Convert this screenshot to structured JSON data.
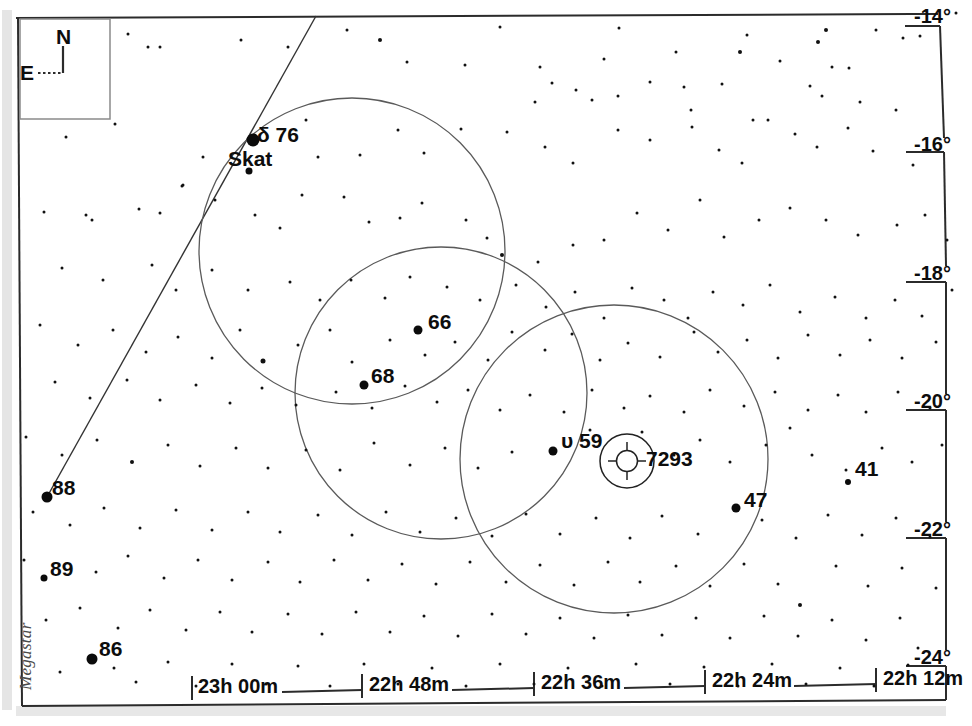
{
  "chart_data": {
    "type": "scatter",
    "xlabel": "Right Ascension",
    "ylabel": "Declination",
    "grid": false,
    "legend": false,
    "x_axis": {
      "position": "bottom",
      "unit": "hours-minutes",
      "direction": "decreasing-right",
      "ticks": [
        {
          "label": "23h 00m",
          "px": 192
        },
        {
          "label": "22h 48m",
          "px": 362
        },
        {
          "label": "22h 36m",
          "px": 534
        },
        {
          "label": "22h 24m",
          "px": 705
        },
        {
          "label": "22h 12m",
          "px": 876
        }
      ],
      "range": [
        "23h 08m",
        "22h 09m"
      ]
    },
    "y_axis": {
      "position": "right",
      "unit": "degrees",
      "direction": "decreasing-down",
      "ticks": [
        {
          "label": "-14°",
          "px": 18
        },
        {
          "label": "-16°",
          "px": 146
        },
        {
          "label": "-18°",
          "px": 275
        },
        {
          "label": "-20°",
          "px": 403
        },
        {
          "label": "-22°",
          "px": 531
        },
        {
          "label": "-24°",
          "px": 659
        }
      ],
      "range": [
        "-13.8°",
        "-24.6°"
      ]
    },
    "labeled_objects": [
      {
        "name": "δ  76",
        "secondary": "Skat",
        "type": "star",
        "x": 253,
        "y": 140,
        "mag_size": 13
      },
      {
        "name": "66",
        "type": "star",
        "x": 418,
        "y": 330,
        "mag_size": 9
      },
      {
        "name": "68",
        "type": "star",
        "x": 364,
        "y": 385,
        "mag_size": 9
      },
      {
        "name": "υ  59",
        "type": "star",
        "x": 553,
        "y": 451,
        "mag_size": 9
      },
      {
        "name": "47",
        "type": "star",
        "x": 736,
        "y": 508,
        "mag_size": 9
      },
      {
        "name": "41",
        "type": "star",
        "x": 848,
        "y": 482,
        "mag_size": 6
      },
      {
        "name": "88",
        "type": "star",
        "x": 47,
        "y": 497,
        "mag_size": 11
      },
      {
        "name": "89",
        "type": "star",
        "x": 44,
        "y": 578,
        "mag_size": 7
      },
      {
        "name": "86",
        "type": "star",
        "x": 92,
        "y": 659,
        "mag_size": 11
      },
      {
        "name": "7293",
        "type": "planetary-nebula",
        "x": 627,
        "y": 461,
        "mag_size": 0
      }
    ],
    "field_circles": [
      {
        "cx": 352,
        "cy": 251,
        "r": 153,
        "note": "finder field 1"
      },
      {
        "cx": 441,
        "cy": 393,
        "r": 146,
        "note": "finder field 2"
      },
      {
        "cx": 614,
        "cy": 459,
        "r": 154,
        "note": "finder field 3"
      },
      {
        "cx": 627,
        "cy": 461,
        "r": 27,
        "note": "nebula extent"
      }
    ],
    "lines": [
      {
        "name": "constellation-line",
        "from": [
          47,
          497
        ],
        "to": [
          315,
          17
        ]
      }
    ]
  },
  "compass": {
    "north_label": "N",
    "east_label": "E"
  },
  "watermark": {
    "text": "Megastar"
  },
  "labels": {
    "delta76": "δ  76",
    "skat": "Skat",
    "s66": "66",
    "s68": "68",
    "upsilon59": "υ  59",
    "n7293": "7293",
    "s47": "47",
    "s41": "41",
    "s88": "88",
    "s89": "89",
    "s86": "86"
  },
  "axis": {
    "ra": {
      "t0": "23h 00m",
      "t1": "22h 48m",
      "t2": "22h 36m",
      "t3": "22h 24m",
      "t4": "22h 12m"
    },
    "dec": {
      "d0": "-14°",
      "d1": "-16°",
      "d2": "-18°",
      "d3": "-20°",
      "d4": "-22°",
      "d5": "-24°"
    }
  },
  "colors": {
    "background": "#ffffff",
    "ink": "#111111",
    "frame": "#2b2b2b",
    "circle": "#555555",
    "watermark": "#4a4a4a"
  },
  "starfield": [
    [
      128,
      34,
      3
    ],
    [
      148,
      47,
      3
    ],
    [
      160,
      47,
      3
    ],
    [
      182,
      186,
      3
    ],
    [
      86,
      215,
      3
    ],
    [
      160,
      213,
      3
    ],
    [
      241,
      40,
      3
    ],
    [
      288,
      47,
      3
    ],
    [
      347,
      30,
      3
    ],
    [
      380,
      40,
      4
    ],
    [
      407,
      62,
      3
    ],
    [
      465,
      65,
      3
    ],
    [
      500,
      27,
      3
    ],
    [
      540,
      67,
      3
    ],
    [
      604,
      59,
      3
    ],
    [
      619,
      28,
      3
    ],
    [
      676,
      52,
      3
    ],
    [
      691,
      110,
      3
    ],
    [
      740,
      52,
      4
    ],
    [
      747,
      35,
      3
    ],
    [
      780,
      61,
      3
    ],
    [
      818,
      42,
      4
    ],
    [
      826,
      30,
      4
    ],
    [
      832,
      67,
      3
    ],
    [
      849,
      68,
      3
    ],
    [
      876,
      30,
      3
    ],
    [
      903,
      38,
      3
    ],
    [
      920,
      36,
      3
    ],
    [
      956,
      13,
      3
    ],
    [
      810,
      86,
      3
    ],
    [
      722,
      84,
      3
    ],
    [
      684,
      87,
      3
    ],
    [
      650,
      82,
      3
    ],
    [
      592,
      100,
      3
    ],
    [
      576,
      90,
      3
    ],
    [
      552,
      83,
      3
    ],
    [
      618,
      96,
      3
    ],
    [
      753,
      120,
      3
    ],
    [
      768,
      120,
      3
    ],
    [
      822,
      96,
      3
    ],
    [
      860,
      102,
      3
    ],
    [
      896,
      110,
      3
    ],
    [
      66,
      137,
      3
    ],
    [
      115,
      124,
      3
    ],
    [
      203,
      157,
      3
    ],
    [
      250,
      170,
      4
    ],
    [
      306,
      120,
      3
    ],
    [
      318,
      157,
      3
    ],
    [
      360,
      155,
      3
    ],
    [
      398,
      130,
      3
    ],
    [
      424,
      153,
      3
    ],
    [
      461,
      129,
      3
    ],
    [
      507,
      132,
      3
    ],
    [
      535,
      102,
      3
    ],
    [
      545,
      147,
      3
    ],
    [
      573,
      163,
      3
    ],
    [
      618,
      130,
      3
    ],
    [
      650,
      140,
      3
    ],
    [
      692,
      127,
      3
    ],
    [
      719,
      150,
      3
    ],
    [
      742,
      163,
      3
    ],
    [
      795,
      134,
      3
    ],
    [
      817,
      147,
      3
    ],
    [
      848,
      128,
      3
    ],
    [
      873,
      151,
      3
    ],
    [
      913,
      165,
      3
    ],
    [
      44,
      212,
      3
    ],
    [
      92,
      220,
      3
    ],
    [
      139,
      209,
      3
    ],
    [
      183,
      185,
      3
    ],
    [
      215,
      200,
      3
    ],
    [
      255,
      215,
      3
    ],
    [
      280,
      228,
      3
    ],
    [
      302,
      195,
      3
    ],
    [
      344,
      197,
      3
    ],
    [
      369,
      222,
      3
    ],
    [
      400,
      218,
      3
    ],
    [
      422,
      203,
      3
    ],
    [
      466,
      220,
      3
    ],
    [
      487,
      238,
      3
    ],
    [
      502,
      255,
      4
    ],
    [
      538,
      262,
      3
    ],
    [
      573,
      245,
      3
    ],
    [
      604,
      240,
      3
    ],
    [
      637,
      213,
      3
    ],
    [
      668,
      230,
      3
    ],
    [
      700,
      200,
      3
    ],
    [
      724,
      237,
      3
    ],
    [
      759,
      220,
      3
    ],
    [
      790,
      208,
      3
    ],
    [
      826,
      220,
      3
    ],
    [
      858,
      235,
      3
    ],
    [
      897,
      225,
      3
    ],
    [
      925,
      215,
      3
    ],
    [
      947,
      240,
      3
    ],
    [
      62,
      268,
      3
    ],
    [
      103,
      280,
      3
    ],
    [
      152,
      265,
      3
    ],
    [
      176,
      290,
      3
    ],
    [
      212,
      270,
      3
    ],
    [
      248,
      290,
      3
    ],
    [
      290,
      282,
      3
    ],
    [
      320,
      300,
      3
    ],
    [
      351,
      280,
      3
    ],
    [
      385,
      298,
      3
    ],
    [
      410,
      277,
      3
    ],
    [
      447,
      287,
      3
    ],
    [
      480,
      300,
      3
    ],
    [
      516,
      285,
      3
    ],
    [
      546,
      307,
      3
    ],
    [
      575,
      292,
      3
    ],
    [
      604,
      318,
      3
    ],
    [
      632,
      288,
      3
    ],
    [
      664,
      300,
      3
    ],
    [
      688,
      318,
      3
    ],
    [
      713,
      292,
      3
    ],
    [
      743,
      305,
      3
    ],
    [
      770,
      285,
      3
    ],
    [
      800,
      312,
      3
    ],
    [
      835,
      297,
      3
    ],
    [
      866,
      318,
      3
    ],
    [
      895,
      300,
      3
    ],
    [
      922,
      316,
      3
    ],
    [
      952,
      290,
      3
    ],
    [
      40,
      325,
      3
    ],
    [
      78,
      345,
      3
    ],
    [
      113,
      330,
      3
    ],
    [
      146,
      352,
      3
    ],
    [
      178,
      337,
      3
    ],
    [
      212,
      358,
      3
    ],
    [
      240,
      330,
      3
    ],
    [
      263,
      361,
      5
    ],
    [
      298,
      345,
      3
    ],
    [
      330,
      330,
      3
    ],
    [
      352,
      362,
      3
    ],
    [
      390,
      340,
      3
    ],
    [
      425,
      355,
      3
    ],
    [
      455,
      342,
      3
    ],
    [
      488,
      360,
      3
    ],
    [
      512,
      332,
      3
    ],
    [
      545,
      350,
      3
    ],
    [
      572,
      334,
      3
    ],
    [
      600,
      360,
      3
    ],
    [
      628,
      343,
      3
    ],
    [
      660,
      357,
      3
    ],
    [
      694,
      332,
      3
    ],
    [
      718,
      352,
      3
    ],
    [
      747,
      340,
      3
    ],
    [
      778,
      358,
      3
    ],
    [
      808,
      335,
      3
    ],
    [
      840,
      355,
      3
    ],
    [
      870,
      340,
      3
    ],
    [
      902,
      358,
      3
    ],
    [
      936,
      342,
      3
    ],
    [
      55,
      382,
      3
    ],
    [
      90,
      398,
      3
    ],
    [
      127,
      380,
      3
    ],
    [
      160,
      400,
      3
    ],
    [
      196,
      385,
      3
    ],
    [
      230,
      403,
      3
    ],
    [
      262,
      388,
      3
    ],
    [
      296,
      405,
      3
    ],
    [
      336,
      392,
      3
    ],
    [
      372,
      408,
      3
    ],
    [
      405,
      386,
      3
    ],
    [
      437,
      402,
      3
    ],
    [
      468,
      390,
      3
    ],
    [
      500,
      410,
      3
    ],
    [
      530,
      395,
      3
    ],
    [
      564,
      412,
      3
    ],
    [
      592,
      390,
      3
    ],
    [
      624,
      408,
      3
    ],
    [
      650,
      396,
      3
    ],
    [
      684,
      412,
      3
    ],
    [
      710,
      390,
      3
    ],
    [
      744,
      406,
      3
    ],
    [
      775,
      392,
      3
    ],
    [
      808,
      410,
      3
    ],
    [
      838,
      395,
      3
    ],
    [
      866,
      412,
      3
    ],
    [
      898,
      392,
      3
    ],
    [
      930,
      408,
      3
    ],
    [
      26,
      437,
      3
    ],
    [
      62,
      455,
      3
    ],
    [
      97,
      440,
      3
    ],
    [
      132,
      462,
      4
    ],
    [
      168,
      445,
      3
    ],
    [
      200,
      466,
      3
    ],
    [
      236,
      448,
      3
    ],
    [
      268,
      468,
      3
    ],
    [
      306,
      450,
      3
    ],
    [
      340,
      470,
      3
    ],
    [
      374,
      443,
      3
    ],
    [
      410,
      465,
      3
    ],
    [
      445,
      448,
      3
    ],
    [
      478,
      468,
      3
    ],
    [
      512,
      452,
      3
    ],
    [
      590,
      430,
      3
    ],
    [
      642,
      432,
      3
    ],
    [
      674,
      455,
      3
    ],
    [
      700,
      440,
      3
    ],
    [
      730,
      462,
      3
    ],
    [
      766,
      445,
      3
    ],
    [
      790,
      428,
      3
    ],
    [
      812,
      455,
      3
    ],
    [
      846,
      470,
      3
    ],
    [
      882,
      448,
      3
    ],
    [
      912,
      462,
      3
    ],
    [
      942,
      445,
      3
    ],
    [
      33,
      512,
      3
    ],
    [
      70,
      525,
      3
    ],
    [
      104,
      508,
      3
    ],
    [
      140,
      528,
      3
    ],
    [
      176,
      510,
      3
    ],
    [
      212,
      530,
      3
    ],
    [
      248,
      512,
      3
    ],
    [
      280,
      532,
      3
    ],
    [
      318,
      515,
      3
    ],
    [
      352,
      535,
      3
    ],
    [
      386,
      512,
      3
    ],
    [
      420,
      532,
      3
    ],
    [
      456,
      518,
      3
    ],
    [
      492,
      536,
      3
    ],
    [
      526,
      514,
      3
    ],
    [
      560,
      534,
      3
    ],
    [
      596,
      518,
      3
    ],
    [
      630,
      538,
      3
    ],
    [
      662,
      516,
      3
    ],
    [
      698,
      534,
      3
    ],
    [
      762,
      520,
      3
    ],
    [
      796,
      538,
      3
    ],
    [
      828,
      515,
      3
    ],
    [
      862,
      535,
      3
    ],
    [
      896,
      518,
      3
    ],
    [
      930,
      537,
      3
    ],
    [
      24,
      560,
      3
    ],
    [
      96,
      572,
      3
    ],
    [
      128,
      556,
      3
    ],
    [
      164,
      578,
      3
    ],
    [
      198,
      560,
      3
    ],
    [
      232,
      580,
      3
    ],
    [
      268,
      562,
      3
    ],
    [
      300,
      582,
      3
    ],
    [
      334,
      560,
      3
    ],
    [
      368,
      580,
      3
    ],
    [
      402,
      564,
      3
    ],
    [
      436,
      584,
      3
    ],
    [
      470,
      562,
      3
    ],
    [
      506,
      582,
      3
    ],
    [
      540,
      565,
      3
    ],
    [
      574,
      585,
      3
    ],
    [
      608,
      562,
      3
    ],
    [
      640,
      582,
      3
    ],
    [
      676,
      566,
      3
    ],
    [
      710,
      586,
      3
    ],
    [
      744,
      564,
      3
    ],
    [
      778,
      584,
      3
    ],
    [
      800,
      605,
      4
    ],
    [
      836,
      566,
      3
    ],
    [
      868,
      586,
      3
    ],
    [
      902,
      568,
      3
    ],
    [
      936,
      588,
      3
    ],
    [
      46,
      620,
      3
    ],
    [
      80,
      608,
      3
    ],
    [
      118,
      628,
      3
    ],
    [
      150,
      610,
      3
    ],
    [
      186,
      630,
      3
    ],
    [
      220,
      612,
      3
    ],
    [
      252,
      632,
      3
    ],
    [
      288,
      614,
      3
    ],
    [
      322,
      634,
      3
    ],
    [
      356,
      612,
      3
    ],
    [
      390,
      632,
      3
    ],
    [
      424,
      616,
      3
    ],
    [
      458,
      636,
      3
    ],
    [
      492,
      614,
      3
    ],
    [
      526,
      634,
      3
    ],
    [
      560,
      618,
      3
    ],
    [
      594,
      638,
      3
    ],
    [
      628,
      615,
      3
    ],
    [
      662,
      635,
      3
    ],
    [
      696,
      618,
      3
    ],
    [
      730,
      638,
      3
    ],
    [
      764,
      616,
      3
    ],
    [
      798,
      636,
      3
    ],
    [
      832,
      620,
      3
    ],
    [
      866,
      640,
      3
    ],
    [
      900,
      618,
      3
    ],
    [
      918,
      648,
      3
    ],
    [
      60,
      672,
      3
    ],
    [
      114,
      668,
      3
    ],
    [
      136,
      682,
      3
    ],
    [
      168,
      662,
      3
    ],
    [
      196,
      686,
      3
    ],
    [
      232,
      664,
      3
    ],
    [
      266,
      684,
      3
    ],
    [
      298,
      666,
      3
    ],
    [
      330,
      686,
      3
    ],
    [
      364,
      664,
      3
    ],
    [
      398,
      684,
      3
    ],
    [
      432,
      668,
      3
    ],
    [
      466,
      686,
      3
    ],
    [
      500,
      664,
      3
    ],
    [
      534,
      684,
      3
    ],
    [
      568,
      668,
      3
    ],
    [
      602,
      686,
      3
    ],
    [
      636,
      664,
      3
    ],
    [
      670,
      684,
      3
    ],
    [
      704,
      667,
      3
    ],
    [
      738,
      686,
      3
    ],
    [
      772,
      664,
      3
    ],
    [
      806,
      684,
      3
    ],
    [
      840,
      668,
      3
    ],
    [
      874,
      686,
      3
    ],
    [
      908,
      665,
      3
    ]
  ]
}
